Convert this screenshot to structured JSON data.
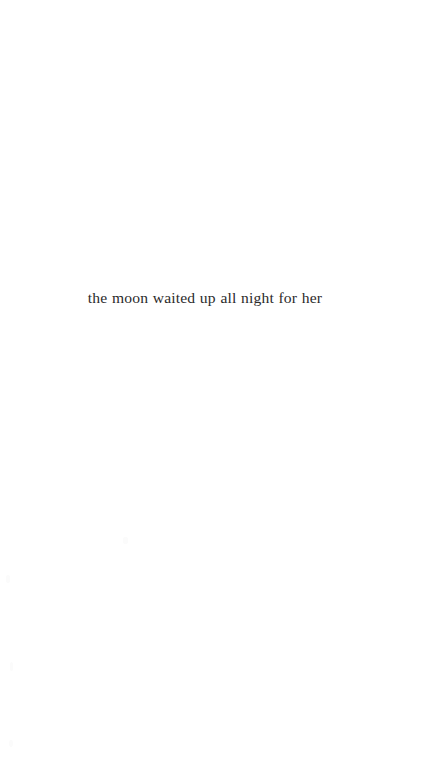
{
  "page": {
    "background_color": "#ffffff",
    "text_color": "#2b2b2b",
    "width": 438,
    "height": 768
  },
  "content": {
    "poem_line": "the moon waited up all night for her"
  },
  "artifacts": {
    "speck_label": ""
  }
}
